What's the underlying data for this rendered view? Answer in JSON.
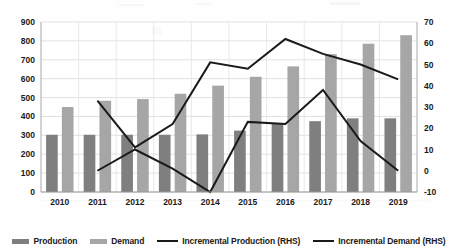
{
  "chart_data": {
    "type": "bar",
    "title": "",
    "xlabel": "",
    "ylabel": "",
    "categories": [
      "2010",
      "2011",
      "2012",
      "2013",
      "2014",
      "2015",
      "2016",
      "2017",
      "2018",
      "2019"
    ],
    "ylim": [
      0,
      900
    ],
    "y2lim": [
      -10,
      70
    ],
    "grid": true,
    "legend_position": "bottom",
    "left_ticks": [
      "0",
      "100",
      "200",
      "300",
      "400",
      "500",
      "600",
      "700",
      "800",
      "900"
    ],
    "left_tick_values": [
      0,
      100,
      200,
      300,
      400,
      500,
      600,
      700,
      800,
      900
    ],
    "right_ticks": [
      "-10",
      "0",
      "10",
      "20",
      "30",
      "40",
      "50",
      "60",
      "70"
    ],
    "right_tick_values": [
      -10,
      0,
      10,
      20,
      30,
      40,
      50,
      60,
      70
    ],
    "series": [
      {
        "name": "Production",
        "type": "bar",
        "axis": "left",
        "color": "#7f7f7f",
        "values": [
          303,
          303,
          303,
          303,
          305,
          325,
          360,
          375,
          390,
          390
        ]
      },
      {
        "name": "Demand",
        "type": "bar",
        "axis": "left",
        "color": "#a6a6a6",
        "values": [
          450,
          483,
          492,
          520,
          563,
          610,
          665,
          730,
          785,
          830
        ]
      },
      {
        "name": "Incremental Production (RHS)",
        "type": "line",
        "axis": "right",
        "color": "#1a1a1a",
        "values": [
          null,
          33,
          11,
          22,
          51,
          48,
          62,
          55,
          50,
          43
        ]
      },
      {
        "name": "Incremental Demand (RHS)",
        "type": "line",
        "axis": "right",
        "color": "#1a1a1a",
        "values": [
          null,
          0,
          10,
          1,
          -10,
          23,
          22,
          38,
          14,
          0
        ]
      }
    ]
  },
  "legend": {
    "items": [
      {
        "label": "Production",
        "marker": "bar",
        "color": "#7f7f7f"
      },
      {
        "label": "Demand",
        "marker": "bar",
        "color": "#a6a6a6"
      },
      {
        "label": "Incremental Production (RHS)",
        "marker": "line",
        "color": "#1a1a1a"
      },
      {
        "label": "Incremental Demand (RHS)",
        "marker": "line",
        "color": "#1a1a1a"
      }
    ]
  }
}
